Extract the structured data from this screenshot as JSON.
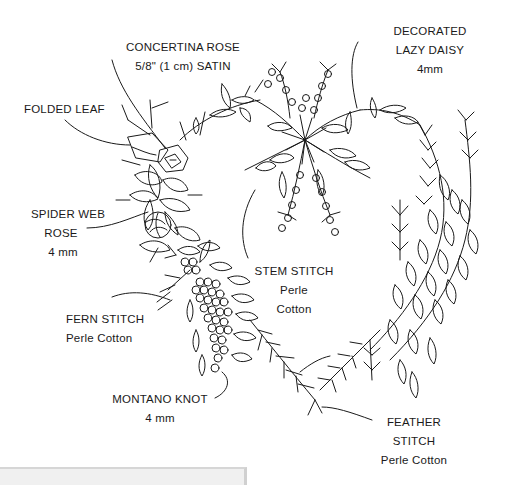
{
  "diagram": {
    "line_color": "#1a1a1a",
    "background": "#ffffff"
  },
  "labels": {
    "concertina_rose": {
      "line1": "CONCERTINA ROSE",
      "line2": "5/8\" (1 cm) SATIN"
    },
    "decorated_lazy_daisy": {
      "line1": "DECORATED",
      "line2": "LAZY DAISY",
      "line3": "4mm"
    },
    "folded_leaf": {
      "line1": "FOLDED LEAF"
    },
    "spider_web_rose": {
      "line1": "SPIDER WEB",
      "line2": "ROSE",
      "line3": "4 mm"
    },
    "stem_stitch": {
      "line1": "STEM STITCH",
      "line2": "Perle",
      "line3": "Cotton"
    },
    "fern_stitch": {
      "line1": "FERN STITCH",
      "line2": "Perle Cotton"
    },
    "montano_knot": {
      "line1": "MONTANO KNOT",
      "line2": "4 mm"
    },
    "feather_stitch": {
      "line1": "FEATHER",
      "line2": "STITCH",
      "line3": "Perle Cotton"
    }
  },
  "panel": {
    "color": "#f0f0f0",
    "border_color": "#d6d6d6"
  }
}
